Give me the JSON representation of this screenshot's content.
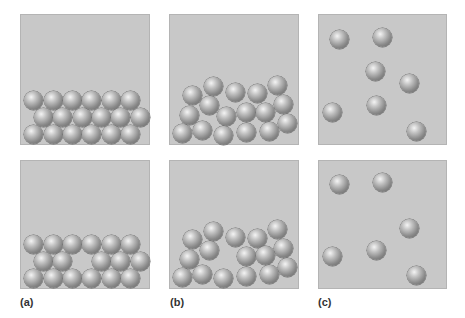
{
  "panels": [
    {
      "id": "a",
      "label": "(a)",
      "state": "solid",
      "x": 20,
      "w": 130
    },
    {
      "id": "b",
      "label": "(b)",
      "state": "liquid",
      "x": 169,
      "w": 130
    },
    {
      "id": "c",
      "label": "(c)",
      "state": "gas",
      "x": 318,
      "w": 129
    }
  ],
  "rows": [
    {
      "id": "top",
      "y": 14,
      "h": 131
    },
    {
      "id": "bottom",
      "y": 160,
      "h": 129
    }
  ],
  "colors": {
    "box_fill": "#c8c8c8",
    "box_border": "#b4b4b4",
    "sphere_highlight": "#f4f4f4",
    "sphere_shadow": "#5e5e5e"
  },
  "sphere_radius": 9.5,
  "spheres": {
    "a_top": [
      [
        33,
        100
      ],
      [
        53,
        100
      ],
      [
        72,
        100
      ],
      [
        91,
        100
      ],
      [
        111,
        100
      ],
      [
        130,
        100
      ],
      [
        43,
        117
      ],
      [
        62,
        117
      ],
      [
        82,
        117
      ],
      [
        101,
        117
      ],
      [
        120,
        117
      ],
      [
        140,
        117
      ],
      [
        33,
        134
      ],
      [
        53,
        134
      ],
      [
        72,
        134
      ],
      [
        91,
        134
      ],
      [
        111,
        134
      ],
      [
        130,
        134
      ]
    ],
    "b_top": [
      [
        192,
        95
      ],
      [
        213,
        86
      ],
      [
        235,
        92
      ],
      [
        257,
        93
      ],
      [
        277,
        85
      ],
      [
        209,
        105
      ],
      [
        283,
        104
      ],
      [
        189,
        115
      ],
      [
        226,
        116
      ],
      [
        246,
        112
      ],
      [
        265,
        112
      ],
      [
        182,
        133
      ],
      [
        202,
        130
      ],
      [
        223,
        135
      ],
      [
        246,
        132
      ],
      [
        269,
        131
      ],
      [
        287,
        123
      ]
    ],
    "c_top": [
      [
        339,
        39
      ],
      [
        382,
        37
      ],
      [
        375,
        71
      ],
      [
        409,
        83
      ],
      [
        332,
        112
      ],
      [
        376,
        105
      ],
      [
        416,
        131
      ]
    ],
    "a_bottom": [
      [
        33,
        244
      ],
      [
        53,
        244
      ],
      [
        72,
        244
      ],
      [
        91,
        244
      ],
      [
        111,
        244
      ],
      [
        130,
        244
      ],
      [
        43,
        261
      ],
      [
        62,
        261
      ],
      [
        101,
        261
      ],
      [
        120,
        261
      ],
      [
        140,
        261
      ],
      [
        33,
        278
      ],
      [
        53,
        278
      ],
      [
        72,
        278
      ],
      [
        91,
        278
      ],
      [
        111,
        278
      ],
      [
        130,
        278
      ]
    ],
    "b_bottom": [
      [
        192,
        239
      ],
      [
        213,
        231
      ],
      [
        235,
        237
      ],
      [
        257,
        238
      ],
      [
        277,
        229
      ],
      [
        209,
        250
      ],
      [
        283,
        248
      ],
      [
        189,
        259
      ],
      [
        246,
        256
      ],
      [
        265,
        255
      ],
      [
        182,
        277
      ],
      [
        202,
        274
      ],
      [
        223,
        278
      ],
      [
        246,
        276
      ],
      [
        269,
        274
      ],
      [
        287,
        267
      ]
    ],
    "c_bottom": [
      [
        339,
        184
      ],
      [
        382,
        182
      ],
      [
        409,
        228
      ],
      [
        332,
        256
      ],
      [
        376,
        250
      ],
      [
        416,
        275
      ]
    ]
  },
  "labels": [
    {
      "text": "(a)",
      "x": 20,
      "y": 296
    },
    {
      "text": "(b)",
      "x": 170,
      "y": 296
    },
    {
      "text": "(c)",
      "x": 318,
      "y": 296
    }
  ]
}
